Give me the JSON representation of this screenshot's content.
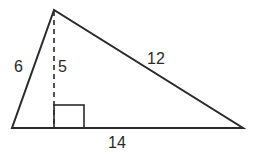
{
  "figure": {
    "type": "triangle with altitude",
    "colors": {
      "stroke": "#2a2a2a",
      "background": "#ffffff"
    },
    "vertices": {
      "apex": [
        54,
        10
      ],
      "bottom_left": [
        12,
        128
      ],
      "bottom_right": [
        243,
        128
      ]
    },
    "altitude": {
      "style": "dashed",
      "from": [
        54,
        10
      ],
      "to": [
        54,
        128
      ]
    },
    "right_angle_marker": {
      "x": 54,
      "y": 105,
      "size": 23,
      "width": 30
    },
    "labels": {
      "left_side": "6",
      "height": "5",
      "right_side": "12",
      "base": "14"
    }
  }
}
